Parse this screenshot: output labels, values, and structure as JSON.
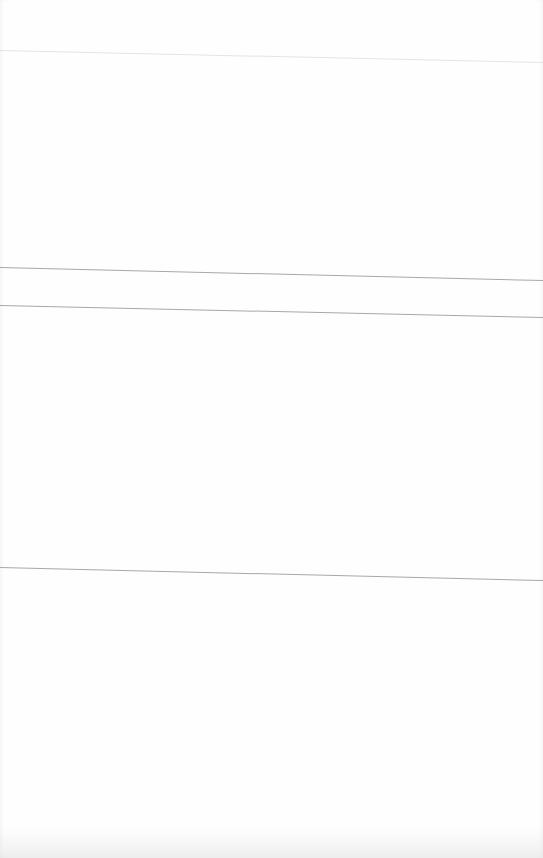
{
  "page": {
    "background": "#ffffff",
    "rule_color": "#a8a8a8",
    "faint_rule_color": "#e4e4e4"
  },
  "rules": [
    {
      "id": "rule-1",
      "y_left": 50,
      "y_right": 62,
      "style": "faint"
    },
    {
      "id": "rule-2",
      "y_left": 267,
      "y_right": 280,
      "style": "gray"
    },
    {
      "id": "rule-3",
      "y_left": 305,
      "y_right": 317,
      "style": "gray"
    },
    {
      "id": "rule-4",
      "y_left": 567,
      "y_right": 580,
      "style": "gray"
    }
  ],
  "sections": [
    {
      "id": "header-band",
      "text": ""
    },
    {
      "id": "upper-block",
      "text": ""
    },
    {
      "id": "narrow-band",
      "text": ""
    },
    {
      "id": "middle-block",
      "text": ""
    },
    {
      "id": "lower-block",
      "text": ""
    }
  ]
}
